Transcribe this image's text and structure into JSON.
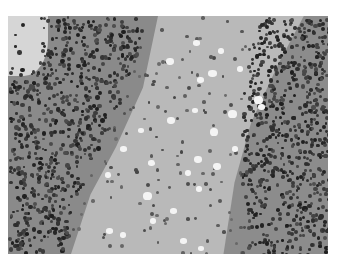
{
  "image": {
    "description": "Grayscale histology micrograph: dense granular cell layers on left and right flanking a paler central region with scattered nuclei and clear vacuoles",
    "colors": {
      "background": "#ffffff",
      "central_matrix": "#b9b9b9",
      "dense_layer": "#8a8a8a",
      "nucleus": "#3a3a3a",
      "vacuole": "#f4f4f4"
    },
    "vacuoles": [
      [
        193,
        40,
        7,
        6
      ],
      [
        218,
        48,
        6,
        6
      ],
      [
        166,
        58,
        8,
        7
      ],
      [
        208,
        70,
        9,
        7
      ],
      [
        237,
        66,
        6,
        6
      ],
      [
        197,
        77,
        7,
        6
      ],
      [
        254,
        96,
        9,
        8
      ],
      [
        258,
        104,
        7,
        6
      ],
      [
        228,
        110,
        9,
        8
      ],
      [
        192,
        108,
        6,
        5
      ],
      [
        167,
        117,
        8,
        7
      ],
      [
        138,
        128,
        6,
        5
      ],
      [
        210,
        128,
        8,
        8
      ],
      [
        120,
        146,
        7,
        6
      ],
      [
        232,
        146,
        6,
        6
      ],
      [
        194,
        156,
        8,
        7
      ],
      [
        148,
        160,
        7,
        6
      ],
      [
        213,
        163,
        8,
        7
      ],
      [
        185,
        170,
        6,
        6
      ],
      [
        105,
        172,
        6,
        6
      ],
      [
        196,
        186,
        6,
        6
      ],
      [
        143,
        192,
        9,
        8
      ],
      [
        170,
        208,
        7,
        6
      ],
      [
        150,
        218,
        6,
        6
      ],
      [
        106,
        228,
        7,
        6
      ],
      [
        120,
        232,
        6,
        6
      ],
      [
        180,
        238,
        7,
        6
      ],
      [
        198,
        246,
        6,
        5
      ]
    ]
  }
}
